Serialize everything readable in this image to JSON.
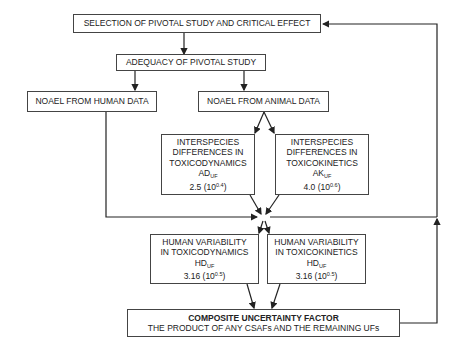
{
  "selection": {
    "label": "SELECTION OF PIVOTAL STUDY AND CRITICAL EFFECT"
  },
  "adequacy": {
    "label": "ADEQUACY OF PIVOTAL STUDY"
  },
  "noael_human": {
    "label": "NOAEL FROM HUMAN DATA"
  },
  "noael_animal": {
    "label": "NOAEL FROM ANIMAL DATA"
  },
  "inter_td": {
    "line1": "INTERSPECIES",
    "line2": "DIFFERENCES IN",
    "line3": "TOXICODYNAMICS",
    "abbr": "AD",
    "abbr_sub": "UF",
    "value": "2.5 (10",
    "exp": "0.4",
    "close": ")"
  },
  "inter_tk": {
    "line1": "INTERSPECIES",
    "line2": "DIFFERENCES IN",
    "line3": "TOXICOKINETICS",
    "abbr": "AK",
    "abbr_sub": "UF",
    "value": "4.0 (10",
    "exp": "0.6",
    "close": ")"
  },
  "human_td": {
    "line1": "HUMAN VARIABILITY",
    "line2": "IN TOXICODYNAMICS",
    "abbr": "HD",
    "abbr_sub": "UF",
    "value": "3.16 (10",
    "exp": "0.5",
    "close": ")"
  },
  "human_tk": {
    "line1": "HUMAN VARIABILITY",
    "line2": "IN TOXICOKINETICS",
    "abbr": "HD",
    "abbr_sub": "UF",
    "value": "3.16 (10",
    "exp": "0.5",
    "close": ")"
  },
  "composite": {
    "title": "COMPOSITE UNCERTAINTY FACTOR",
    "subtitle": "THE PRODUCT OF ANY CSAFs AND THE REMAINING UFs"
  }
}
